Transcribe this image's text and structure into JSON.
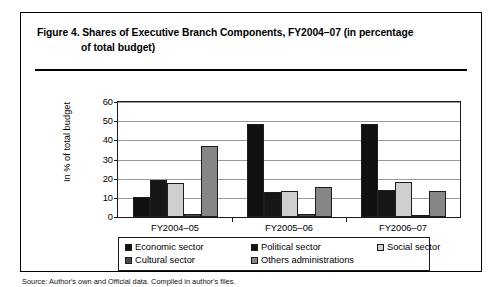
{
  "figure": {
    "title_line1": "Figure 4.  Shares of Executive Branch Components, FY2004–07 (in percentage",
    "title_line2": "of total budget)",
    "source_note": "Source: Author's own and Official data. Compiled in author's files."
  },
  "chart_data": {
    "type": "bar",
    "title": "Shares of Executive Branch Components, FY2004–07 (in percentage of total budget)",
    "xlabel": "",
    "ylabel": "In % of total budget",
    "ylim": [
      0,
      60
    ],
    "yticks": [
      0,
      10,
      20,
      30,
      40,
      50,
      60
    ],
    "ytick_labels": [
      "0",
      "10",
      "20",
      "30",
      "40",
      "50",
      "60"
    ],
    "grid": true,
    "legend_position": "bottom",
    "categories": [
      "FY2004–05",
      "FY2005–06",
      "FY2006–07"
    ],
    "series": [
      {
        "name": "Economic sector",
        "color": "#111111",
        "values": [
          10.5,
          48.5,
          48.5
        ]
      },
      {
        "name": "Political sector",
        "color": "#161616",
        "values": [
          19.5,
          13.0,
          14.0
        ]
      },
      {
        "name": "Social sector",
        "color": "#cfcfcf",
        "values": [
          17.5,
          13.5,
          18.5
        ]
      },
      {
        "name": "Cultural sector",
        "color": "#4a4a4a",
        "values": [
          1.5,
          1.5,
          1.0
        ]
      },
      {
        "name": "Others administrations",
        "color": "#868686",
        "values": [
          37.0,
          15.5,
          13.5
        ]
      }
    ]
  },
  "legend": {
    "row1": [
      {
        "label": "Economic sector"
      },
      {
        "label": "Political sector"
      },
      {
        "label": "Social sector"
      }
    ],
    "row2": [
      {
        "label": "Cultural sector"
      },
      {
        "label": "Others administrations"
      }
    ]
  }
}
